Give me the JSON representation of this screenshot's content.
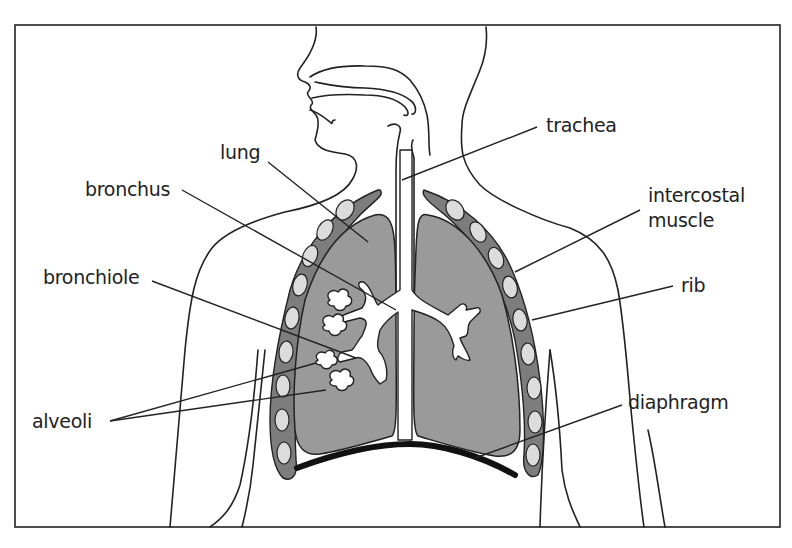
{
  "diagram": {
    "labels": {
      "lung": "lung",
      "bronchus": "bronchus",
      "bronchiole": "bronchiole",
      "alveoli": "alveoli",
      "trachea": "trachea",
      "intercostal_line1": "intercostal",
      "intercostal_line2": "muscle",
      "rib": "rib",
      "diaphragm": "diaphragm"
    },
    "colors": {
      "lung_fill": "#9a9a9a",
      "ribcage_fill": "#7d7d7d",
      "rib_fill": "#dcdcdc",
      "line": "#222222",
      "diaphragm": "#111111"
    }
  }
}
